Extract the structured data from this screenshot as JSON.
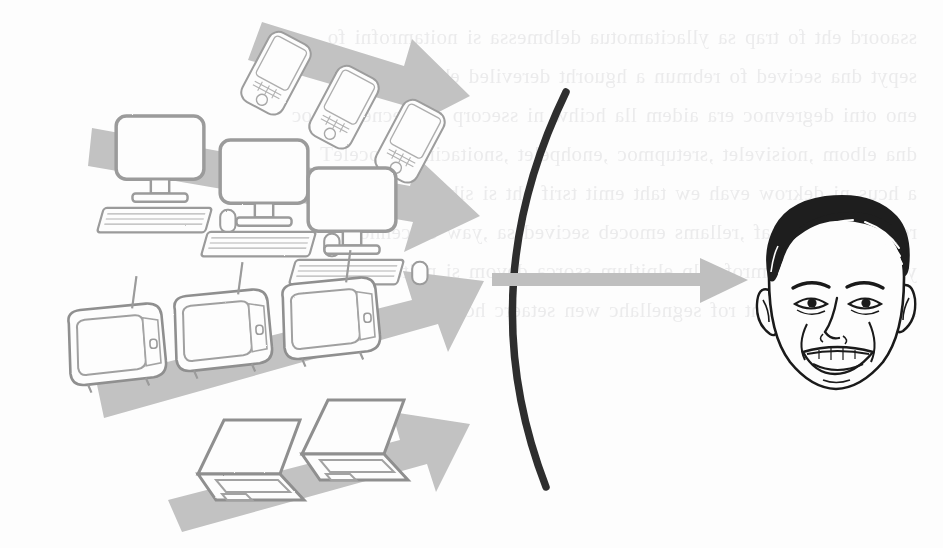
{
  "page": {
    "kind": "scanned-book-figure",
    "background_color": "#fdfdfd",
    "width": 943,
    "height": 548
  },
  "bleed_through": {
    "note": "faint show-through text from the reverse side of the scanned page; largely illegible",
    "color": "#ebebec",
    "lines": [
      "ssaoord eht fo trap sa yllacitamotua delbmessa si noitamrofni fo",
      "sepyt dna secived fo rebmun a hguorht dereviled eb nac tnetnoc",
      "eno otni degrevnoc era aidem lla hcihw ni ssecorp a si ecnegrevnoc",
      "dna elbom ,noisivelet ,sretupmoc ,enohpelet ,snoitacinummoceleT",
      "a hcus ni dekrow evah ew taht emit tsrif eht si siht dna ,tenretni",
      "reidnah dna retsaf ,rellams emoceb secived sa ,yaw detcennoc",
      "ylsuoenatlumis smrofetalp elpitlum ssorca devom si noitamrofni",
      "reganam aidem eht rof segnellahc wen setaerc hcihw"
    ]
  },
  "figure": {
    "colors": {
      "arrow_gray": "#bdbdbd",
      "arrow_gray_light": "#c9c9c9",
      "device_outline": "#9a9a9a",
      "device_fill": "#fdfdfd",
      "lens_black": "#2b2b2b",
      "face_ink": "#1a1a1a"
    },
    "converging_arrows": [
      {
        "id": "arrow-phones",
        "label": "smartphones arrow",
        "direction": "down-right"
      },
      {
        "id": "arrow-desktops",
        "label": "desktop computers arrow",
        "direction": "down-right"
      },
      {
        "id": "arrow-televisions",
        "label": "televisions arrow",
        "direction": "up-right"
      },
      {
        "id": "arrow-laptops",
        "label": "laptops arrow",
        "direction": "up-right"
      }
    ],
    "device_groups": [
      {
        "id": "phones",
        "name": "smartphones",
        "count": 3
      },
      {
        "id": "desktops",
        "name": "desktop computers",
        "count": 3
      },
      {
        "id": "televisions",
        "name": "televisions",
        "count": 3
      },
      {
        "id": "laptops",
        "name": "laptops",
        "count": 2
      }
    ],
    "lens": {
      "id": "lens-arc",
      "name": "convergence lens arc",
      "orientation": "opens-left"
    },
    "output_arrow": {
      "id": "arrow-to-viewer",
      "name": "output arrow to viewer",
      "direction": "right"
    },
    "viewer": {
      "id": "viewer-face",
      "name": "smiling man face illustration"
    }
  }
}
